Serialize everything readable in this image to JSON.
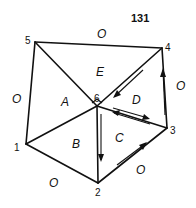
{
  "page_number": "131",
  "vertices": [
    {
      "id": "1",
      "label": "1"
    },
    {
      "id": "2",
      "label": "2"
    },
    {
      "id": "3",
      "label": "3"
    },
    {
      "id": "4",
      "label": "4"
    },
    {
      "id": "5",
      "label": "5"
    },
    {
      "id": "6",
      "label": "6"
    }
  ],
  "faces": [
    {
      "id": "A",
      "label": "A"
    },
    {
      "id": "B",
      "label": "B"
    },
    {
      "id": "C",
      "label": "C"
    },
    {
      "id": "D",
      "label": "D"
    },
    {
      "id": "E",
      "label": "E"
    }
  ],
  "outer_labels": [
    {
      "edge": "5-4",
      "label": "O"
    },
    {
      "edge": "4-3",
      "label": "O"
    },
    {
      "edge": "3-2",
      "label": "O"
    },
    {
      "edge": "2-1",
      "label": "O"
    },
    {
      "edge": "1-5",
      "label": "O"
    }
  ],
  "edges": [
    "1-5",
    "5-4",
    "4-3",
    "3-2",
    "2-1",
    "5-6",
    "4-6",
    "3-6",
    "2-6",
    "1-6"
  ],
  "flow_arrows": [
    {
      "along": "4-6",
      "direction": "toward 6"
    },
    {
      "along": "6-3",
      "direction": "toward 3"
    },
    {
      "along": "3-6",
      "direction": "toward 6"
    },
    {
      "along": "3-4",
      "direction": "toward 4"
    },
    {
      "along": "2-3",
      "direction": "toward 3"
    },
    {
      "along": "6-2",
      "direction": "toward 2"
    }
  ]
}
